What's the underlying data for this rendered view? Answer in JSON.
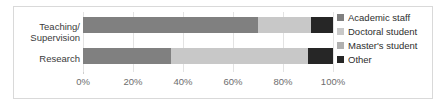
{
  "chart_data": {
    "type": "bar",
    "orientation": "horizontal",
    "stacked": true,
    "normalized_percent": true,
    "title": "",
    "xlabel": "",
    "ylabel": "",
    "categories": [
      "Teaching/ Supervision",
      "Research"
    ],
    "category_lines": [
      [
        "Teaching/",
        "Supervision"
      ],
      [
        "Research"
      ]
    ],
    "series": [
      {
        "name": "Academic staff",
        "color": "#808080",
        "values": [
          70,
          35
        ]
      },
      {
        "name": "Doctoral student",
        "color": "#c8c8c8",
        "values": [
          21,
          55
        ]
      },
      {
        "name": "Master's student",
        "color": "#b0b0b0",
        "values": [
          0,
          0
        ]
      },
      {
        "name": "Other",
        "color": "#262626",
        "values": [
          9,
          10
        ]
      }
    ],
    "xlim": [
      0,
      100
    ],
    "xticks": [
      0,
      20,
      40,
      60,
      80,
      100
    ],
    "xticklabels": [
      "0%",
      "20%",
      "40%",
      "60%",
      "80%",
      "100%"
    ],
    "grid": true,
    "grid_axis": "x",
    "legend_position": "right"
  },
  "legend": {
    "items": [
      {
        "label": "Academic staff",
        "swatch": "#808080"
      },
      {
        "label": "Doctoral student",
        "swatch": "#c8c8c8"
      },
      {
        "label": "Master's student",
        "swatch": "#b0b0b0"
      },
      {
        "label": "Other",
        "swatch": "#262626"
      }
    ]
  },
  "style": {
    "frame_color": "#d9d9d9",
    "gridline_color": "#e3e3e3",
    "axis_color": "#cfcfcf",
    "tick_text_color": "#6d6d6d",
    "category_text_color": "#3b3b3b",
    "legend_text_color": "#2e2e2e",
    "background": "#ffffff"
  }
}
